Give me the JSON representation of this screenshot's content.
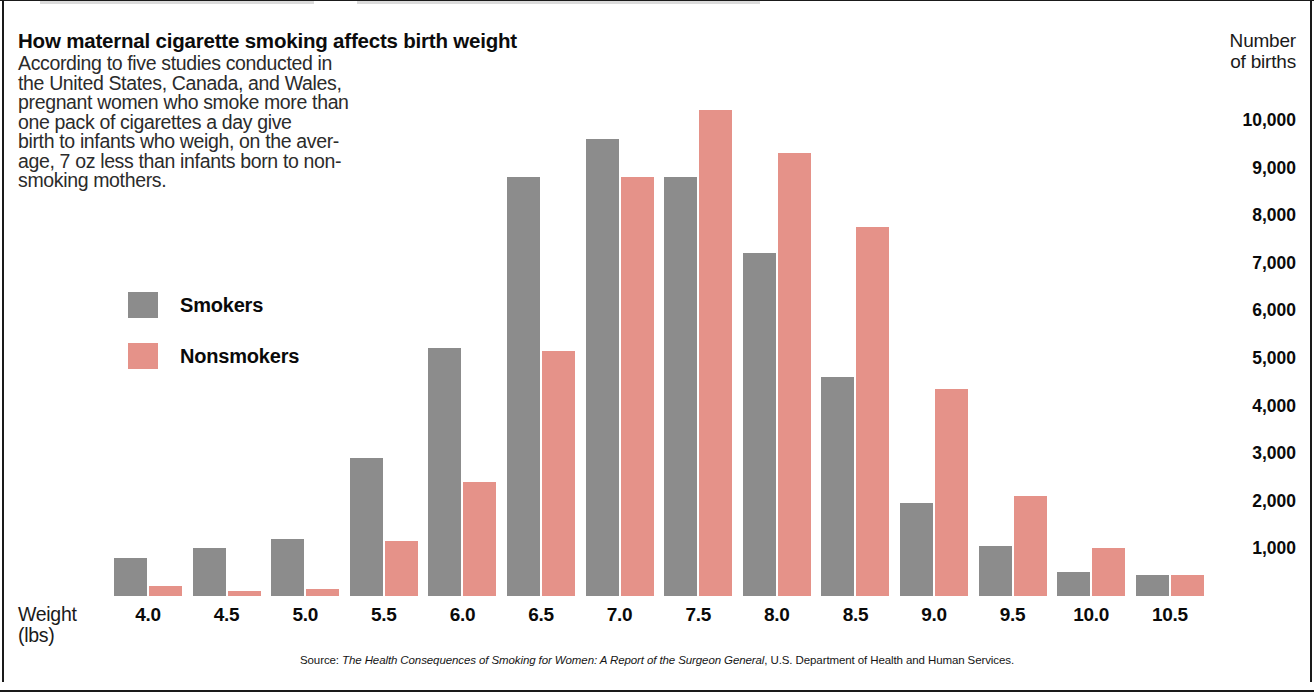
{
  "headline": "How maternal cigarette smoking affects birth weight",
  "deck_lines": [
    "According to five studies conducted in",
    "the United States, Canada, and Wales,",
    "pregnant women who smoke more than",
    "one pack of cigarettes a day give",
    "birth to infants who weigh, on the aver-",
    "age, 7 oz less than infants born to non-",
    "smoking mothers."
  ],
  "axis": {
    "y_title_lines": [
      "Number",
      "of births"
    ],
    "x_title_lines": [
      "Weight",
      "(lbs)"
    ]
  },
  "legend": {
    "items": [
      {
        "label": "Smokers",
        "color": "#8c8c8c",
        "key": "smokers"
      },
      {
        "label": "Nonsmokers",
        "color": "#e59289",
        "key": "nonsmokers"
      }
    ]
  },
  "source": {
    "prefix": "Source: ",
    "italic_title": "The Health Consequences of Smoking for Women: A Report of the Surgeon General",
    "suffix": ", U.S. Department of Health and Human Services."
  },
  "colors": {
    "smokers": "#8c8c8c",
    "nonsmokers": "#e59289",
    "text": "#0a0a0a",
    "rule": "#1a1a1a"
  },
  "chart_data": {
    "type": "bar",
    "title": "How maternal cigarette smoking affects birth weight",
    "xlabel": "Weight (lbs)",
    "ylabel": "Number of births",
    "ylim": [
      0,
      10500
    ],
    "grid": false,
    "legend_position": "inside-left",
    "ytick_labels": [
      "10,000",
      "9,000",
      "8,000",
      "7,000",
      "6,000",
      "5,000",
      "4,000",
      "3,000",
      "2,000",
      "1,000"
    ],
    "ytick_values": [
      10000,
      9000,
      8000,
      7000,
      6000,
      5000,
      4000,
      3000,
      2000,
      1000
    ],
    "categories": [
      "4.0",
      "4.5",
      "5.0",
      "5.5",
      "6.0",
      "6.5",
      "7.0",
      "7.5",
      "8.0",
      "8.5",
      "9.0",
      "9.5",
      "10.0",
      "10.5"
    ],
    "series": [
      {
        "name": "Smokers",
        "color": "#8c8c8c",
        "values": [
          800,
          1000,
          1200,
          2900,
          5200,
          8800,
          9600,
          8800,
          7200,
          4600,
          1950,
          1050,
          500,
          450
        ]
      },
      {
        "name": "Nonsmokers",
        "color": "#e59289",
        "values": [
          200,
          100,
          150,
          1150,
          2400,
          5150,
          8800,
          10200,
          9300,
          7750,
          4350,
          2100,
          1000,
          450
        ]
      }
    ]
  }
}
